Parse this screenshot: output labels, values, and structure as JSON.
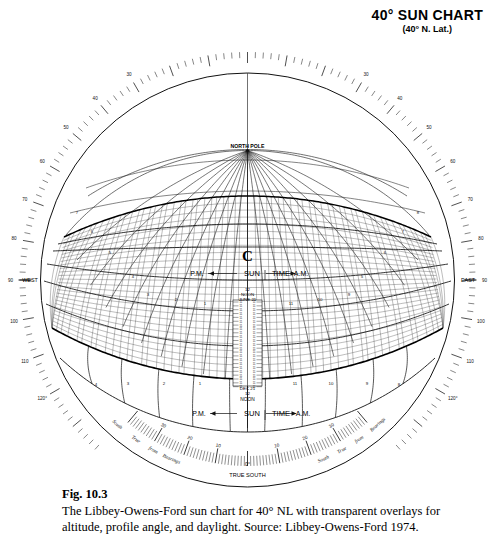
{
  "title": {
    "main": "40° SUN CHART",
    "sub": "(40° N. Lat.)"
  },
  "caption": {
    "figure": "Fig. 10.3",
    "text": "The Libbey-Owens-Ford sun chart for 40° NL with transparent overlays for altitude, profile angle, and daylight. Source: Libbey-Owens-Ford 1974."
  },
  "chart": {
    "north_pole_label": "NORTH POLE",
    "center_mark": "C",
    "true_south_label": "TRUE SOUTH",
    "true_south_zero": "0°",
    "west_label": "WEST",
    "east_label": "EAST",
    "sun_time_label": "SUN",
    "sun_time_label2": "TIME",
    "pm_label": "P.M.",
    "am_label": "A.M.",
    "noon_top": {
      "hour": "12",
      "word": "NOON",
      "date": "JUNE 21"
    },
    "noon_bottom": {
      "date": "DEC 21",
      "hour": "12",
      "word": "NOON"
    },
    "bearings_words_left": [
      "Bearings",
      "from",
      "True",
      "South"
    ],
    "bearings_words_right": [
      "Bearings",
      "from",
      "True",
      "South"
    ],
    "bearings_ticks_left": [
      "30",
      "20",
      "10"
    ],
    "bearings_ticks_right": [
      "10",
      "20",
      "30"
    ],
    "azimuth_labels_left": [
      "120°",
      "110",
      "100",
      "90",
      "80",
      "70",
      "60",
      "50",
      "40",
      "30"
    ],
    "azimuth_labels_right": [
      "120°",
      "110",
      "100",
      "90",
      "80",
      "70",
      "60",
      "50",
      "40",
      "30"
    ],
    "hour_labels_upper": [
      "3",
      "2",
      "1",
      "11",
      "10",
      "9"
    ],
    "hour_labels_lower": [
      "4",
      "3",
      "2",
      "1",
      "11",
      "10",
      "9",
      "8"
    ],
    "meridian_labels_left": [
      "7",
      "6",
      "5",
      "4"
    ],
    "meridian_labels_right": [
      "5",
      "6",
      "7",
      "8"
    ]
  },
  "chart_data": {
    "type": "scatter",
    "title": "40° SUN CHART (40° N. Lat.)",
    "xlabel": "Bearings from True South (degrees)",
    "ylabel": "Altitude / Declination",
    "projection": "gnomonic-spherical sun path chart",
    "latitude_deg": 40,
    "grid": true,
    "legend": "none",
    "azimuth_scale": {
      "unit": "degrees",
      "left_ticks": [
        120,
        110,
        100,
        90,
        80,
        70,
        60,
        50,
        40,
        30
      ],
      "right_ticks": [
        120,
        110,
        100,
        90,
        80,
        70,
        60,
        50,
        40,
        30
      ],
      "cardinal_west_at": 90,
      "cardinal_east_at": 90
    },
    "bearing_scale": {
      "center": 0,
      "center_label": "TRUE SOUTH",
      "left_ticks": [
        10,
        20,
        30
      ],
      "right_ticks": [
        10,
        20,
        30
      ],
      "tick_interval_deg": 1
    },
    "sun_paths": [
      {
        "name": "June 21",
        "declination_deg": 23.5,
        "noon_altitude_deg": 73.5
      },
      {
        "name": "May 21 / Jul 21",
        "declination_deg": 20.0,
        "noon_altitude_deg": 70.0
      },
      {
        "name": "Apr 21 / Aug 21",
        "declination_deg": 11.8,
        "noon_altitude_deg": 61.8
      },
      {
        "name": "Mar 21 / Sep 21",
        "declination_deg": 0.0,
        "noon_altitude_deg": 50.0
      },
      {
        "name": "Feb 21 / Oct 21",
        "declination_deg": -11.8,
        "noon_altitude_deg": 38.2
      },
      {
        "name": "Jan 21 / Nov 21",
        "declination_deg": -20.0,
        "noon_altitude_deg": 30.0
      },
      {
        "name": "Dec 21",
        "declination_deg": -23.5,
        "noon_altitude_deg": 26.5
      }
    ],
    "hour_lines": [
      {
        "label": "12",
        "time": "NOON"
      },
      {
        "label": "11",
        "time": "A.M."
      },
      {
        "label": "10",
        "time": "A.M."
      },
      {
        "label": "9",
        "time": "A.M."
      },
      {
        "label": "8",
        "time": "A.M."
      },
      {
        "label": "7",
        "time": "A.M."
      },
      {
        "label": "6",
        "time": "A.M."
      },
      {
        "label": "5",
        "time": "A.M."
      },
      {
        "label": "1",
        "time": "P.M."
      },
      {
        "label": "2",
        "time": "P.M."
      },
      {
        "label": "3",
        "time": "P.M."
      },
      {
        "label": "4",
        "time": "P.M."
      },
      {
        "label": "5",
        "time": "P.M."
      },
      {
        "label": "6",
        "time": "P.M."
      },
      {
        "label": "7",
        "time": "P.M."
      }
    ],
    "annotations": [
      "NORTH POLE",
      "SUN TIME",
      "P.M.",
      "A.M.",
      "12 NOON JUNE 21",
      "DEC 21 12 NOON",
      "TRUE SOUTH",
      "WEST",
      "EAST",
      "Bearings from True South"
    ]
  }
}
